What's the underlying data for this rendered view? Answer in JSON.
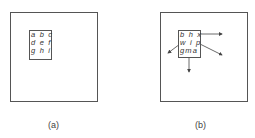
{
  "panels": [
    {
      "id": "a",
      "caption": "(a)",
      "grid": [
        "a b c",
        "d e f",
        "g h i"
      ]
    },
    {
      "id": "b",
      "caption": "(b)",
      "grid": [
        "b h x",
        "w i p",
        "gma"
      ],
      "arrows": [
        "right",
        "lower-right",
        "lower-left",
        "down"
      ]
    }
  ],
  "colors": {
    "stroke": "#555555",
    "text": "#333333"
  }
}
